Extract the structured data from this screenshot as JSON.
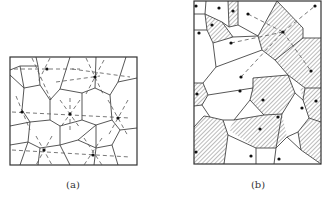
{
  "figure": {
    "panels": [
      {
        "id": "a",
        "caption": "(a)",
        "caption_pos": [
          73,
          179
        ],
        "frame": [
          10,
          57,
          137,
          165
        ],
        "edges": [
          [
            10,
            70,
            20,
            66
          ],
          [
            36,
            57,
            38,
            66
          ],
          [
            20,
            66,
            38,
            66
          ],
          [
            38,
            66,
            40,
            85
          ],
          [
            20,
            66,
            24,
            88
          ],
          [
            10,
            75,
            24,
            88
          ],
          [
            24,
            88,
            40,
            85
          ],
          [
            40,
            85,
            50,
            100
          ],
          [
            24,
            88,
            22,
            110
          ],
          [
            50,
            100,
            60,
            89
          ],
          [
            60,
            89,
            70,
            57
          ],
          [
            60,
            89,
            82,
            93
          ],
          [
            82,
            93,
            95,
            88
          ],
          [
            95,
            88,
            96,
            57
          ],
          [
            95,
            88,
            110,
            95
          ],
          [
            110,
            95,
            118,
            82
          ],
          [
            118,
            82,
            126,
            57
          ],
          [
            118,
            82,
            137,
            78
          ],
          [
            110,
            95,
            112,
            120
          ],
          [
            112,
            120,
            120,
            130
          ],
          [
            120,
            130,
            137,
            128
          ],
          [
            112,
            120,
            96,
            125
          ],
          [
            50,
            100,
            50,
            120
          ],
          [
            50,
            120,
            60,
            126
          ],
          [
            60,
            126,
            82,
            120
          ],
          [
            82,
            120,
            82,
            93
          ],
          [
            82,
            120,
            96,
            125
          ],
          [
            22,
            110,
            30,
            122
          ],
          [
            30,
            122,
            50,
            120
          ],
          [
            10,
            126,
            30,
            122
          ],
          [
            30,
            122,
            28,
            142
          ],
          [
            28,
            142,
            10,
            145
          ],
          [
            28,
            142,
            40,
            148
          ],
          [
            40,
            148,
            60,
            145
          ],
          [
            60,
            145,
            60,
            126
          ],
          [
            60,
            145,
            70,
            165
          ],
          [
            60,
            145,
            78,
            140
          ],
          [
            78,
            140,
            96,
            125
          ],
          [
            78,
            140,
            96,
            148
          ],
          [
            96,
            148,
            96,
            125
          ],
          [
            96,
            148,
            112,
            145
          ],
          [
            112,
            145,
            120,
            130
          ],
          [
            112,
            145,
            118,
            165
          ],
          [
            96,
            148,
            94,
            165
          ],
          [
            40,
            148,
            38,
            165
          ],
          [
            28,
            142,
            20,
            165
          ],
          [
            96,
            125,
            96,
            125
          ]
        ],
        "sites": [
          [
            47,
            69
          ],
          [
            95,
            77
          ],
          [
            22,
            112
          ],
          [
            70,
            114
          ],
          [
            118,
            118
          ],
          [
            44,
            150
          ],
          [
            93,
            155
          ]
        ],
        "dashed": [
          [
            [
              14,
              69
            ],
            [
              80,
              69
            ]
          ],
          [
            [
              72,
              69
            ],
            [
              130,
              77
            ]
          ],
          [
            [
              12,
              112
            ],
            [
              130,
              118
            ]
          ],
          [
            [
              12,
              150
            ],
            [
              130,
              157
            ]
          ],
          [
            [
              32,
              58
            ],
            [
              52,
              102
            ]
          ],
          [
            [
              50,
              58
            ],
            [
              38,
              82
            ]
          ],
          [
            [
              86,
              58
            ],
            [
              104,
              96
            ]
          ],
          [
            [
              104,
              60
            ],
            [
              86,
              94
            ]
          ],
          [
            [
              16,
              96
            ],
            [
              30,
              130
            ]
          ],
          [
            [
              70,
              98
            ],
            [
              70,
              132
            ]
          ],
          [
            [
              60,
              100
            ],
            [
              80,
              128
            ]
          ],
          [
            [
              80,
              100
            ],
            [
              60,
              128
            ]
          ],
          [
            [
              108,
              100
            ],
            [
              128,
              136
            ]
          ],
          [
            [
              128,
              100
            ],
            [
              108,
              136
            ]
          ],
          [
            [
              36,
              136
            ],
            [
              52,
              165
            ]
          ],
          [
            [
              52,
              136
            ],
            [
              36,
              165
            ]
          ],
          [
            [
              84,
              138
            ],
            [
              102,
              165
            ]
          ],
          [
            [
              102,
              138
            ],
            [
              84,
              165
            ]
          ],
          [
            [
              56,
              82
            ],
            [
              100,
              76
            ]
          ]
        ]
      },
      {
        "id": "b",
        "caption": "(b)",
        "caption_pos": [
          258,
          179
        ],
        "frame": [
          194,
          1,
          321,
          164
        ],
        "hatched_regions": [
          [
            [
              205,
              14
            ],
            [
              222,
              22
            ],
            [
              233,
              37
            ],
            [
              213,
              43
            ],
            [
              207,
              30
            ]
          ],
          [
            [
              228,
              1
            ],
            [
              238,
              1
            ],
            [
              238,
              25
            ],
            [
              229,
              27
            ]
          ],
          [
            [
              277,
              1
            ],
            [
              303,
              28
            ],
            [
              303,
              38
            ],
            [
              275,
              60
            ],
            [
              262,
              50
            ],
            [
              258,
              36
            ]
          ],
          [
            [
              275,
              60
            ],
            [
              303,
              38
            ],
            [
              321,
              38
            ],
            [
              321,
              88
            ],
            [
              305,
              88
            ],
            [
              288,
              75
            ]
          ],
          [
            [
              194,
              83
            ],
            [
              203,
              83
            ],
            [
              208,
              95
            ],
            [
              202,
              105
            ],
            [
              194,
              106
            ]
          ],
          [
            [
              253,
              78
            ],
            [
              288,
              75
            ],
            [
              295,
              93
            ],
            [
              282,
              114
            ],
            [
              264,
              115
            ],
            [
              250,
              100
            ]
          ],
          [
            [
              300,
              88
            ],
            [
              321,
              88
            ],
            [
              321,
              122
            ],
            [
              309,
              118
            ],
            [
              303,
              100
            ]
          ],
          [
            [
              204,
              116
            ],
            [
              223,
              120
            ],
            [
              228,
              135
            ],
            [
              224,
              164
            ],
            [
              194,
              164
            ],
            [
              194,
              127
            ]
          ],
          [
            [
              234,
              120
            ],
            [
              264,
              115
            ],
            [
              282,
              114
            ],
            [
              287,
              137
            ],
            [
              276,
              148
            ],
            [
              256,
              148
            ],
            [
              229,
              130
            ]
          ],
          [
            [
              298,
              132
            ],
            [
              309,
              118
            ],
            [
              321,
              122
            ],
            [
              321,
              164
            ],
            [
              301,
              150
            ]
          ]
        ],
        "edges": [
          [
            194,
            14,
            205,
            14
          ],
          [
            205,
            14,
            206,
            1
          ],
          [
            205,
            14,
            207,
            30
          ],
          [
            207,
            30,
            194,
            30
          ],
          [
            207,
            30,
            213,
            43
          ],
          [
            213,
            43,
            233,
            37
          ],
          [
            222,
            22,
            233,
            37
          ],
          [
            205,
            14,
            222,
            22
          ],
          [
            222,
            22,
            229,
            27
          ],
          [
            229,
            27,
            228,
            1
          ],
          [
            229,
            27,
            238,
            25
          ],
          [
            238,
            25,
            238,
            1
          ],
          [
            238,
            25,
            258,
            36
          ],
          [
            258,
            36,
            277,
            1
          ],
          [
            258,
            36,
            262,
            50
          ],
          [
            233,
            37,
            258,
            36
          ],
          [
            213,
            43,
            216,
            67
          ],
          [
            216,
            67,
            262,
            50
          ],
          [
            262,
            50,
            275,
            60
          ],
          [
            277,
            1,
            303,
            28
          ],
          [
            303,
            28,
            303,
            38
          ],
          [
            303,
            38,
            275,
            60
          ],
          [
            303,
            38,
            321,
            38
          ],
          [
            275,
            60,
            288,
            75
          ],
          [
            216,
            67,
            203,
            83
          ],
          [
            203,
            83,
            194,
            83
          ],
          [
            203,
            83,
            208,
            95
          ],
          [
            208,
            95,
            253,
            88
          ],
          [
            253,
            88,
            253,
            78
          ],
          [
            253,
            78,
            288,
            75
          ],
          [
            288,
            75,
            305,
            88
          ],
          [
            305,
            88,
            321,
            88
          ],
          [
            288,
            75,
            295,
            93
          ],
          [
            295,
            93,
            282,
            114
          ],
          [
            305,
            88,
            303,
            100
          ],
          [
            303,
            100,
            309,
            118
          ],
          [
            309,
            118,
            321,
            122
          ],
          [
            295,
            93,
            303,
            100
          ],
          [
            253,
            88,
            250,
            100
          ],
          [
            250,
            100,
            264,
            115
          ],
          [
            264,
            115,
            282,
            114
          ],
          [
            208,
            95,
            202,
            105
          ],
          [
            202,
            105,
            194,
            106
          ],
          [
            202,
            105,
            210,
            117
          ],
          [
            210,
            117,
            223,
            120
          ],
          [
            223,
            120,
            234,
            120
          ],
          [
            234,
            120,
            250,
            100
          ],
          [
            210,
            117,
            204,
            116
          ],
          [
            204,
            116,
            194,
            127
          ],
          [
            223,
            120,
            228,
            135
          ],
          [
            228,
            135,
            224,
            164
          ],
          [
            228,
            135,
            256,
            148
          ],
          [
            256,
            148,
            276,
            148
          ],
          [
            276,
            148,
            282,
            114
          ],
          [
            276,
            148,
            287,
            137
          ],
          [
            287,
            137,
            298,
            132
          ],
          [
            298,
            132,
            309,
            118
          ],
          [
            287,
            137,
            301,
            150
          ],
          [
            301,
            150,
            321,
            164
          ],
          [
            298,
            132,
            301,
            150
          ],
          [
            276,
            148,
            274,
            164
          ],
          [
            256,
            148,
            256,
            164
          ],
          [
            234,
            120,
            264,
            115
          ]
        ],
        "sites": [
          [
            196,
            6
          ],
          [
            219,
            8
          ],
          [
            233,
            11
          ],
          [
            248,
            14
          ],
          [
            315,
            6
          ],
          [
            212,
            25
          ],
          [
            199,
            33
          ],
          [
            231,
            43
          ],
          [
            283,
            32
          ],
          [
            311,
            71
          ],
          [
            241,
            77
          ],
          [
            240,
            91
          ],
          [
            197,
            94
          ],
          [
            263,
            100
          ],
          [
            316,
            101
          ],
          [
            302,
            108
          ],
          [
            278,
            117
          ],
          [
            260,
            129
          ],
          [
            196,
            152
          ],
          [
            251,
            156
          ],
          [
            279,
            159
          ]
        ],
        "dashed": [
          [
            [
              248,
              14
            ],
            [
              283,
              32
            ]
          ],
          [
            [
              283,
              32
            ],
            [
              315,
              6
            ]
          ],
          [
            [
              283,
              32
            ],
            [
              311,
              71
            ]
          ],
          [
            [
              231,
              43
            ],
            [
              283,
              32
            ]
          ],
          [
            [
              241,
              77
            ],
            [
              283,
              32
            ]
          ]
        ]
      }
    ]
  }
}
